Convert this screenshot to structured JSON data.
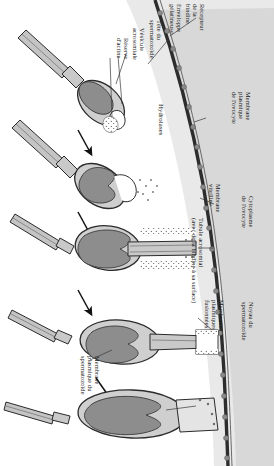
{
  "figure": {
    "orientation": "labels rotated 90 degrees clockwise",
    "background_color": "#ffffff",
    "ink_color": "#1a1a1a"
  },
  "colors": {
    "jelly_coat": "#e8e8e8",
    "oocyte_cytoplasm": "#d6d6d6",
    "sperm_cytoplasm": "#c9c9c9",
    "sperm_nucleus": "#8e8e8e",
    "acrosome_vesicle": "#ffffff",
    "vitelline_membrane": "#3a3a3a",
    "receptor_dot": "#7d7d7d",
    "outline": "#2b2b2b",
    "arrow": "#111111"
  },
  "labels": {
    "receptor_bindine": "Récepteur\nde la\nbindine",
    "jelly_envelope": "Enveloppe\ngélatineuse",
    "sperm_head": "Tête du\nspermatozoïde",
    "acrosomal_vesicle": "Vésicule\nacrosomiale",
    "actin_reserve": "Réserve\nd'actine",
    "hydrolases": "Hydrolases",
    "oocyte_plasma_membrane": "Membrane\nplasmique\nde l'ovocyte",
    "vitelline_membrane": "Membrane\nvitelline",
    "acrosomal_tubule": "Tubule acrosomial\n(avec de la bindine à sa surface)",
    "oocyte_cytoplasm": "Cytoplasme\nde l'ovocyte",
    "fused_plasma_membranes": "Membranes\nplasmiques\nfusionnées",
    "sperm_nucleus": "Noyau du\nspermatozoïde",
    "sperm_plasma_membrane": "Membrane\nplasmique du\nspermatozoïde"
  },
  "stages": [
    {
      "id": "stage-1",
      "caption": "Contact du spermatozoïde avec l'enveloppe gélatineuse"
    },
    {
      "id": "stage-2",
      "caption": "Exocytose de la vésicule acrosomiale"
    },
    {
      "id": "stage-3",
      "caption": "Formation du tubule acrosomial"
    },
    {
      "id": "stage-4",
      "caption": "Contact du tubule avec la membrane plasmique de l'ovocyte"
    },
    {
      "id": "stage-5",
      "caption": "Fusion des membranes et entrée du noyau"
    }
  ],
  "arrows": [
    {
      "id": "arrow-1-2"
    },
    {
      "id": "arrow-2-3"
    },
    {
      "id": "arrow-3-4"
    },
    {
      "id": "arrow-4-5"
    }
  ]
}
